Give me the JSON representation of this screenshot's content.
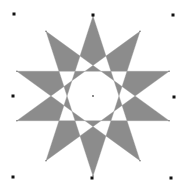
{
  "canvas": {
    "width": 189,
    "height": 187,
    "background": "#ffffff"
  },
  "shape": {
    "type": "star",
    "points": 10,
    "center": [
      93,
      96
    ],
    "outer_radius": 80,
    "fill": "#8c8c8c",
    "fill_rule": "evenodd",
    "selected": true
  },
  "selection_handles": {
    "color": "#111111",
    "positions": [
      [
        14,
        14
      ],
      [
        93,
        15
      ],
      [
        173,
        15
      ],
      [
        13,
        96
      ],
      [
        174,
        97
      ],
      [
        13,
        177
      ],
      [
        92,
        178
      ],
      [
        171,
        178
      ]
    ]
  },
  "center_marker": {
    "color": "#555555"
  }
}
